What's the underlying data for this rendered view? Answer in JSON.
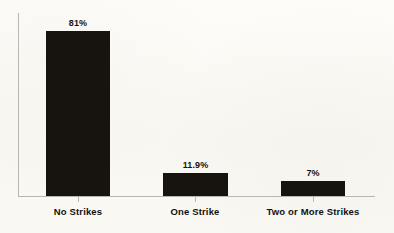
{
  "chart_data": {
    "type": "bar",
    "title": "",
    "subtitle": "",
    "xlabel": "",
    "ylabel": "",
    "categories": [
      "No Strikes",
      "One Strike",
      "Two or More Strikes"
    ],
    "values": [
      81,
      11.9,
      7
    ],
    "value_labels": [
      "81%",
      "11.9%",
      "7%"
    ],
    "ylim": [
      0,
      88
    ],
    "grid": false,
    "legend": false,
    "legend_position": "none",
    "bar_color": "#17140f",
    "axis_color": "#b9b8b0",
    "background_color": "#faf9f4",
    "text_color": "#121212"
  },
  "bars": [
    {
      "category": "No Strikes",
      "value_label": "81%",
      "left_px": 46,
      "width_px": 64,
      "height_px": 165,
      "center_px": 78
    },
    {
      "category": "One Strike",
      "value_label": "11.9%",
      "left_px": 163,
      "width_px": 65,
      "height_px": 23,
      "center_px": 195
    },
    {
      "category": "Two or More Strikes",
      "value_label": "7%",
      "left_px": 281,
      "width_px": 64,
      "height_px": 15,
      "center_px": 313
    }
  ]
}
